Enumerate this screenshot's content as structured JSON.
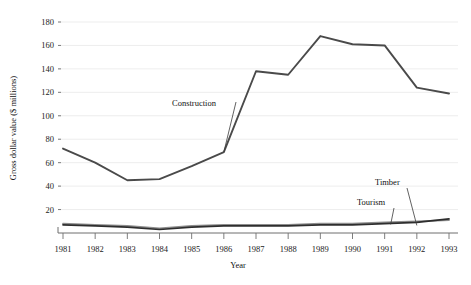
{
  "chart_data": {
    "type": "line",
    "title": "",
    "xlabel": "Year",
    "ylabel": "Gross dollar value ($ millions)",
    "categories": [
      "1981",
      "1982",
      "1983",
      "1984",
      "1985",
      "1986",
      "1987",
      "1988",
      "1989",
      "1990",
      "1991",
      "1992",
      "1993"
    ],
    "x": [
      1981,
      1982,
      1983,
      1984,
      1985,
      1986,
      1987,
      1988,
      1989,
      1990,
      1991,
      1992,
      1993
    ],
    "xlim": [
      1981,
      1993
    ],
    "ylim": [
      0,
      188
    ],
    "yticks": [
      20,
      40,
      60,
      80,
      100,
      120,
      140,
      160,
      180
    ],
    "ytick_labels": [
      "20",
      "40",
      "60",
      "80",
      "100",
      "120",
      "140",
      "160",
      "180"
    ],
    "xtick_labels": [
      "1981",
      "1982",
      "1983",
      "1984",
      "1985",
      "1986",
      "1987",
      "1988",
      "1989",
      "1990",
      "1991",
      "1992",
      "1993"
    ],
    "grid": "horizontal",
    "legend": "inline-annotations",
    "series": [
      {
        "name": "Construction",
        "color": "#4a4a4a",
        "values": [
          72,
          60,
          45,
          46,
          57,
          69,
          138,
          135,
          168,
          161,
          160,
          124,
          119
        ],
        "label": "Construction",
        "label_x": 1984.3,
        "label_y": 108
      },
      {
        "name": "Timber",
        "color": "#2e2e2e",
        "values": [
          7,
          6,
          5,
          3,
          5,
          6,
          6,
          6,
          7,
          7,
          8,
          9,
          12
        ],
        "label": "Timber",
        "label_x": 1991.2,
        "label_y": 36
      },
      {
        "name": "Tourism",
        "color": "#8d8d8d",
        "values": [
          8,
          7,
          6,
          4,
          6,
          7,
          7,
          7,
          8,
          8,
          9,
          10,
          11
        ],
        "label": "Tourism",
        "label_x": 1990.6,
        "label_y": 22
      }
    ],
    "annotations": [
      {
        "text": "Construction",
        "target_series": "Construction"
      },
      {
        "text": "Timber",
        "target_series": "Timber"
      },
      {
        "text": "Tourism",
        "target_series": "Tourism"
      }
    ]
  }
}
